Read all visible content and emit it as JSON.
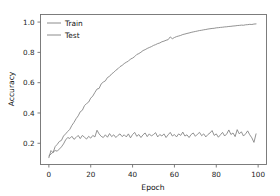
{
  "chart_data": {
    "type": "line",
    "title": "",
    "xlabel": "Epoch",
    "ylabel": "Accuracy",
    "xlim": [
      -4,
      104
    ],
    "ylim": [
      0.06,
      1.05
    ],
    "grid": false,
    "legend_position": "upper left",
    "xticks": [
      "0",
      "20",
      "40",
      "60",
      "80",
      "100"
    ],
    "xtick_values": [
      0,
      20,
      40,
      60,
      80,
      100
    ],
    "yticks": [
      "0.2",
      "0.4",
      "0.6",
      "0.8",
      "1.0"
    ],
    "ytick_values": [
      0.2,
      0.4,
      0.6,
      0.8,
      1.0
    ],
    "line_color": "#808080",
    "x": [
      0,
      1,
      2,
      3,
      4,
      5,
      6,
      7,
      8,
      9,
      10,
      11,
      12,
      13,
      14,
      15,
      16,
      17,
      18,
      19,
      20,
      21,
      22,
      23,
      24,
      25,
      26,
      27,
      28,
      29,
      30,
      31,
      32,
      33,
      34,
      35,
      36,
      37,
      38,
      39,
      40,
      41,
      42,
      43,
      44,
      45,
      46,
      47,
      48,
      49,
      50,
      51,
      52,
      53,
      54,
      55,
      56,
      57,
      58,
      59,
      60,
      61,
      62,
      63,
      64,
      65,
      66,
      67,
      68,
      69,
      70,
      71,
      72,
      73,
      74,
      75,
      76,
      77,
      78,
      79,
      80,
      81,
      82,
      83,
      84,
      85,
      86,
      87,
      88,
      89,
      90,
      91,
      92,
      93,
      94,
      95,
      96,
      97,
      98,
      99
    ],
    "series": [
      {
        "name": "Train",
        "values": [
          0.105,
          0.152,
          0.138,
          0.178,
          0.193,
          0.212,
          0.219,
          0.248,
          0.262,
          0.278,
          0.292,
          0.318,
          0.338,
          0.362,
          0.381,
          0.408,
          0.418,
          0.448,
          0.462,
          0.472,
          0.498,
          0.512,
          0.536,
          0.558,
          0.562,
          0.592,
          0.604,
          0.612,
          0.634,
          0.642,
          0.658,
          0.668,
          0.682,
          0.692,
          0.706,
          0.714,
          0.726,
          0.735,
          0.742,
          0.756,
          0.762,
          0.772,
          0.786,
          0.792,
          0.801,
          0.812,
          0.818,
          0.826,
          0.832,
          0.838,
          0.846,
          0.851,
          0.858,
          0.862,
          0.87,
          0.874,
          0.88,
          0.884,
          0.902,
          0.89,
          0.898,
          0.904,
          0.908,
          0.912,
          0.918,
          0.921,
          0.925,
          0.928,
          0.932,
          0.935,
          0.938,
          0.941,
          0.944,
          0.946,
          0.949,
          0.951,
          0.954,
          0.956,
          0.958,
          0.959,
          0.962,
          0.963,
          0.965,
          0.966,
          0.968,
          0.969,
          0.971,
          0.972,
          0.974,
          0.975,
          0.977,
          0.978,
          0.98,
          0.979,
          0.982,
          0.983,
          0.985,
          0.984,
          0.987,
          0.988
        ]
      },
      {
        "name": "Test",
        "values": [
          0.118,
          0.128,
          0.142,
          0.152,
          0.148,
          0.162,
          0.176,
          0.196,
          0.222,
          0.238,
          0.232,
          0.246,
          0.226,
          0.238,
          0.252,
          0.231,
          0.252,
          0.24,
          0.228,
          0.246,
          0.234,
          0.252,
          0.242,
          0.286,
          0.262,
          0.246,
          0.238,
          0.256,
          0.24,
          0.264,
          0.244,
          0.256,
          0.238,
          0.252,
          0.262,
          0.244,
          0.256,
          0.242,
          0.262,
          0.236,
          0.258,
          0.272,
          0.246,
          0.258,
          0.238,
          0.256,
          0.268,
          0.244,
          0.262,
          0.248,
          0.258,
          0.27,
          0.242,
          0.258,
          0.248,
          0.262,
          0.238,
          0.256,
          0.272,
          0.248,
          0.258,
          0.242,
          0.262,
          0.252,
          0.274,
          0.248,
          0.256,
          0.238,
          0.258,
          0.268,
          0.246,
          0.26,
          0.272,
          0.25,
          0.262,
          0.242,
          0.258,
          0.268,
          0.284,
          0.252,
          0.262,
          0.24,
          0.256,
          0.272,
          0.248,
          0.262,
          0.288,
          0.258,
          0.268,
          0.244,
          0.29,
          0.262,
          0.276,
          0.248,
          0.262,
          0.282,
          0.256,
          0.236,
          0.206,
          0.262
        ]
      }
    ]
  },
  "legend": {
    "entries": [
      {
        "label": "Train"
      },
      {
        "label": "Test"
      }
    ]
  }
}
